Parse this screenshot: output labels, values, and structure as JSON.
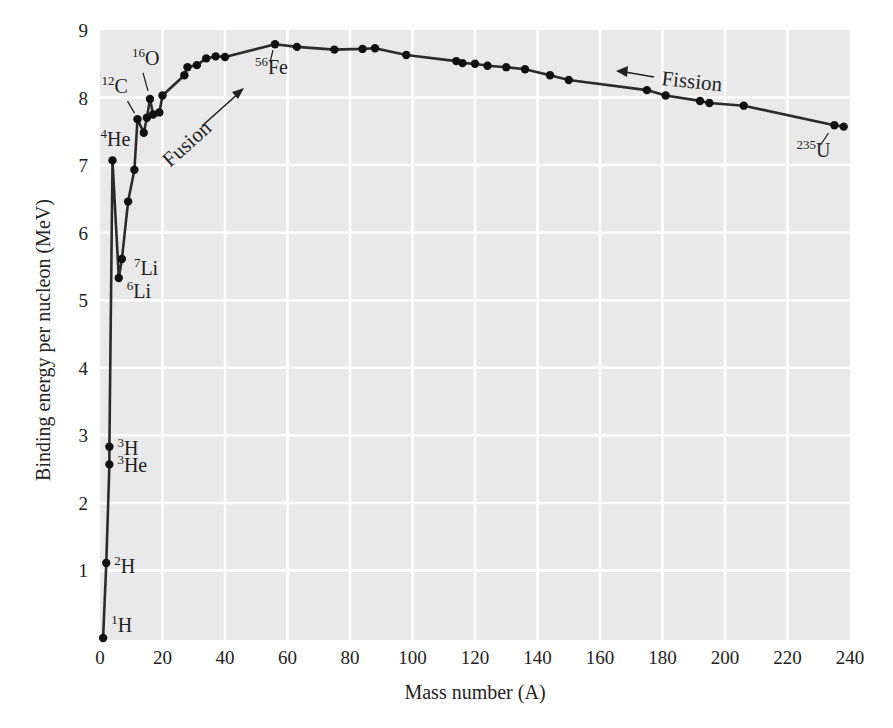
{
  "page": {
    "top_cut_text": "y  …  gy  …  ,  y"
  },
  "chart_data": {
    "type": "line",
    "title": "",
    "xlabel": "Mass number (A)",
    "ylabel": "Binding energy per nucleon (MeV)",
    "xlim": [
      0,
      240
    ],
    "ylim": [
      0,
      9
    ],
    "x_ticks": [
      0,
      20,
      40,
      60,
      80,
      100,
      120,
      140,
      160,
      180,
      200,
      220,
      240
    ],
    "y_ticks": [
      1,
      2,
      3,
      4,
      5,
      6,
      7,
      8,
      9
    ],
    "grid": true,
    "legend": null,
    "series": [
      {
        "name": "Binding energy per nucleon",
        "points": [
          {
            "x": 1,
            "y": 0.0
          },
          {
            "x": 2,
            "y": 1.11
          },
          {
            "x": 3,
            "y": 2.57
          },
          {
            "x": 3,
            "y": 2.83
          },
          {
            "x": 4,
            "y": 7.07
          },
          {
            "x": 6,
            "y": 5.33
          },
          {
            "x": 7,
            "y": 5.61
          },
          {
            "x": 9,
            "y": 6.46
          },
          {
            "x": 11,
            "y": 6.93
          },
          {
            "x": 12,
            "y": 7.68
          },
          {
            "x": 14,
            "y": 7.48
          },
          {
            "x": 15,
            "y": 7.7
          },
          {
            "x": 16,
            "y": 7.98
          },
          {
            "x": 17,
            "y": 7.75
          },
          {
            "x": 19,
            "y": 7.78
          },
          {
            "x": 20,
            "y": 8.03
          },
          {
            "x": 27,
            "y": 8.33
          },
          {
            "x": 28,
            "y": 8.45
          },
          {
            "x": 31,
            "y": 8.48
          },
          {
            "x": 34,
            "y": 8.58
          },
          {
            "x": 37,
            "y": 8.61
          },
          {
            "x": 40,
            "y": 8.6
          },
          {
            "x": 56,
            "y": 8.79
          },
          {
            "x": 63,
            "y": 8.75
          },
          {
            "x": 75,
            "y": 8.71
          },
          {
            "x": 84,
            "y": 8.72
          },
          {
            "x": 88,
            "y": 8.73
          },
          {
            "x": 98,
            "y": 8.63
          },
          {
            "x": 114,
            "y": 8.54
          },
          {
            "x": 116,
            "y": 8.51
          },
          {
            "x": 120,
            "y": 8.5
          },
          {
            "x": 124,
            "y": 8.47
          },
          {
            "x": 130,
            "y": 8.45
          },
          {
            "x": 136,
            "y": 8.42
          },
          {
            "x": 144,
            "y": 8.33
          },
          {
            "x": 150,
            "y": 8.26
          },
          {
            "x": 175,
            "y": 8.11
          },
          {
            "x": 181,
            "y": 8.03
          },
          {
            "x": 192,
            "y": 7.95
          },
          {
            "x": 195,
            "y": 7.92
          },
          {
            "x": 206,
            "y": 7.88
          },
          {
            "x": 235,
            "y": 7.59
          },
          {
            "x": 238,
            "y": 7.57
          }
        ]
      }
    ],
    "annotations": [
      {
        "mass": "1",
        "symbol": "H",
        "x": 1,
        "y": 0.0
      },
      {
        "mass": "2",
        "symbol": "H",
        "x": 2,
        "y": 1.11
      },
      {
        "mass": "3",
        "symbol": "He",
        "x": 3,
        "y": 2.57
      },
      {
        "mass": "3",
        "symbol": "H",
        "x": 3,
        "y": 2.83
      },
      {
        "mass": "4",
        "symbol": "He",
        "x": 4,
        "y": 7.07
      },
      {
        "mass": "6",
        "symbol": "Li",
        "x": 6,
        "y": 5.33
      },
      {
        "mass": "7",
        "symbol": "Li",
        "x": 7,
        "y": 5.61
      },
      {
        "mass": "12",
        "symbol": "C",
        "x": 12,
        "y": 7.68
      },
      {
        "mass": "16",
        "symbol": "O",
        "x": 16,
        "y": 7.98
      },
      {
        "mass": "56",
        "symbol": "Fe",
        "x": 56,
        "y": 8.79
      },
      {
        "mass": "235",
        "symbol": "U",
        "x": 235,
        "y": 7.59
      }
    ],
    "arrows": [
      {
        "label": "Fusion",
        "direction": "up-right"
      },
      {
        "label": "Fission",
        "direction": "left"
      }
    ],
    "colors": {
      "plot_background": "#e9e9e9",
      "grid": "#ffffff",
      "line": "#2b2b2b",
      "marker": "#111111",
      "text": "#222222"
    }
  }
}
